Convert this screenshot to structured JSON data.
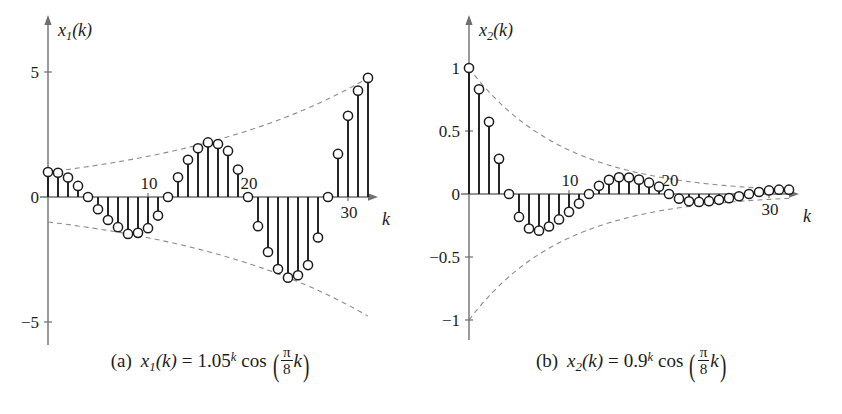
{
  "figure": {
    "background": "#ffffff",
    "ink": "#1c1c1c",
    "dash_color": "#8c8c8c",
    "axis_color": "#6f6f6f"
  },
  "panels": [
    {
      "id": "panel-a",
      "caption": {
        "tag": "(a)",
        "func_name": "x",
        "func_sub": "1",
        "func_arg": "(k)",
        "equals": "=",
        "base": "1.05",
        "exponent": "k",
        "cos": "cos",
        "frac_num": "π",
        "frac_den": "8",
        "frac_var": "k",
        "text": "(a)  x₁(k) = 1.05ᵏ cos(π/8 k)"
      },
      "y_axis_label": {
        "name": "x",
        "sub": "1",
        "arg": "(k)"
      },
      "x_axis_label": "k",
      "y_ticks": [
        {
          "value": 5,
          "label": "5"
        },
        {
          "value": 0,
          "label": "0"
        },
        {
          "value": -5,
          "label": "−5"
        }
      ],
      "x_ticks": [
        {
          "value": 10,
          "label": "10"
        },
        {
          "value": 20,
          "label": "20"
        },
        {
          "value": 30,
          "label": "30"
        }
      ],
      "chart_data": {
        "type": "stem",
        "title": "",
        "xlabel": "k",
        "ylabel": "x1(k)",
        "xlim": [
          -1,
          33
        ],
        "ylim": [
          -5.6,
          5.6
        ],
        "grid": false,
        "legend": "none",
        "formula": "x1(k) = 1.05^k * cos(pi/8 * k)",
        "envelope": {
          "type": "dashed",
          "upper": "1.05^k",
          "lower": "-1.05^k"
        },
        "x": [
          0,
          1,
          2,
          3,
          4,
          5,
          6,
          7,
          8,
          9,
          10,
          11,
          12,
          13,
          14,
          15,
          16,
          17,
          18,
          19,
          20,
          21,
          22,
          23,
          24,
          25,
          26,
          27,
          28,
          29,
          30,
          31,
          32
        ],
        "values": [
          1.0,
          0.97,
          0.781,
          0.443,
          0.0,
          -0.489,
          -0.921,
          -1.207,
          -1.477,
          -1.434,
          -1.247,
          -0.742,
          0.0,
          0.79,
          1.489,
          1.95,
          2.183,
          2.119,
          1.843,
          1.097,
          0.0,
          -1.167,
          -2.2,
          -2.881,
          -3.225,
          -3.13,
          -2.721,
          -1.619,
          0.0,
          1.723,
          3.249,
          4.254,
          4.764
        ],
        "displayed_values": [
          1.0,
          0.97,
          0.78,
          0.44,
          0.0,
          -0.49,
          -0.92,
          -1.21,
          -1.48,
          -1.43,
          -1.25,
          -0.74,
          0.0,
          0.79,
          1.49,
          1.95,
          2.18,
          2.12,
          1.84,
          1.1,
          0.0,
          -1.17,
          -2.2,
          -2.88,
          -3.23,
          -3.13,
          -2.72,
          -1.62,
          0.0,
          1.72,
          3.25,
          4.25,
          4.76
        ]
      }
    },
    {
      "id": "panel-b",
      "caption": {
        "tag": "(b)",
        "func_name": "x",
        "func_sub": "2",
        "func_arg": "(k)",
        "equals": "=",
        "base": "0.9",
        "exponent": "k",
        "cos": "cos",
        "frac_num": "π",
        "frac_den": "8",
        "frac_var": "k",
        "text": "(b)  x₂(k) = 0.9ᵏ cos(π/8 k)"
      },
      "y_axis_label": {
        "name": "x",
        "sub": "2",
        "arg": "(k)"
      },
      "x_axis_label": "k",
      "y_ticks": [
        {
          "value": 1,
          "label": "1"
        },
        {
          "value": 0.5,
          "label": "0.5"
        },
        {
          "value": 0,
          "label": "0"
        },
        {
          "value": -0.5,
          "label": "−0.5"
        },
        {
          "value": -1,
          "label": "−1"
        }
      ],
      "x_ticks": [
        {
          "value": 10,
          "label": "10"
        },
        {
          "value": 20,
          "label": "20"
        },
        {
          "value": 30,
          "label": "30"
        }
      ],
      "chart_data": {
        "type": "stem",
        "title": "",
        "xlabel": "k",
        "ylabel": "x2(k)",
        "xlim": [
          -1,
          33
        ],
        "ylim": [
          -1.12,
          1.12
        ],
        "grid": false,
        "legend": "none",
        "formula": "x2(k) = 0.9^k * cos(pi/8 * k)",
        "envelope": {
          "type": "dashed",
          "upper": "0.9^k",
          "lower": "-0.9^k"
        },
        "x": [
          0,
          1,
          2,
          3,
          4,
          5,
          6,
          7,
          8,
          9,
          10,
          11,
          12,
          13,
          14,
          15,
          16,
          17,
          18,
          19,
          20,
          21,
          22,
          23,
          24,
          25,
          26,
          27,
          28,
          29,
          30,
          31,
          32
        ],
        "values": [
          1.0,
          0.831,
          0.573,
          0.279,
          0.0,
          -0.182,
          -0.274,
          -0.291,
          -0.258,
          -0.202,
          -0.142,
          -0.076,
          0.0,
          0.065,
          0.112,
          0.133,
          0.131,
          0.114,
          0.09,
          0.058,
          0.0,
          -0.037,
          -0.058,
          -0.063,
          -0.057,
          -0.046,
          -0.033,
          -0.018,
          0.0,
          0.016,
          0.028,
          0.034,
          0.034
        ],
        "displayed_values": [
          1.0,
          0.83,
          0.57,
          0.28,
          0.0,
          -0.18,
          -0.27,
          -0.29,
          -0.26,
          -0.2,
          -0.14,
          -0.08,
          0.0,
          0.07,
          0.11,
          0.13,
          0.13,
          0.11,
          0.09,
          0.06,
          0.0,
          -0.04,
          -0.06,
          -0.06,
          -0.06,
          -0.05,
          -0.03,
          -0.02,
          0.0,
          0.02,
          0.03,
          0.03,
          0.03
        ]
      }
    }
  ]
}
